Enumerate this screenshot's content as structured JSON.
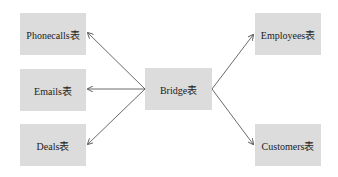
{
  "diagram": {
    "center": {
      "label": "Bridge表"
    },
    "left": [
      {
        "label": "Phonecalls表"
      },
      {
        "label": "Emails表"
      },
      {
        "label": "Deals表"
      }
    ],
    "right": [
      {
        "label": "Employees表"
      },
      {
        "label": "Customers表"
      }
    ],
    "colors": {
      "box": "#dcdcdc",
      "arrow": "#444444",
      "text": "#222222"
    }
  }
}
